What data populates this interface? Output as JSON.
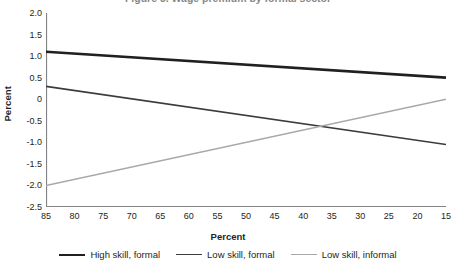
{
  "title": {
    "text": "Figure 3. Wage premium by formal sector",
    "clipped": true
  },
  "axis_titles": {
    "y": "Percent",
    "x": "Percent"
  },
  "colors": {
    "high_skill_formal": "#231f20",
    "low_skill_formal": "#3b3b3b",
    "low_skill_informal": "#a6a8ab",
    "axis": "#808285",
    "text": "#231f20"
  },
  "legend": {
    "position": "bottom",
    "items": [
      {
        "label": "High skill, formal",
        "color": "#231f20",
        "width": 2.6
      },
      {
        "label": "Low skill, formal",
        "color": "#3b3b3b",
        "width": 1.8
      },
      {
        "label": "Low skill, informal",
        "color": "#a6a8ab",
        "width": 1.4
      }
    ]
  },
  "chart_data": {
    "type": "line",
    "title": "Figure 3. Wage premium by formal sector",
    "xlabel": "Percent",
    "ylabel": "Percent",
    "xlim": [
      85,
      15
    ],
    "ylim": [
      -2.5,
      2.0
    ],
    "x_reversed": true,
    "grid": false,
    "xticks": [
      85,
      80,
      75,
      70,
      65,
      60,
      55,
      50,
      45,
      40,
      35,
      30,
      25,
      20,
      15
    ],
    "yticks": [
      2.0,
      1.5,
      1.0,
      0.5,
      0,
      -0.5,
      -1.0,
      -1.5,
      -2.0,
      -2.5
    ],
    "ytick_labels": [
      "2.0",
      "1.5",
      "1.0",
      "0.5",
      "0",
      "-0.5",
      "-1.0",
      "-1.5",
      "-2.0",
      "-2.5"
    ],
    "x": [
      85,
      15
    ],
    "series": [
      {
        "name": "High skill, formal",
        "color": "#231f20",
        "values": [
          1.1,
          0.5
        ]
      },
      {
        "name": "Low skill, formal",
        "color": "#3b3b3b",
        "values": [
          0.3,
          -1.05
        ]
      },
      {
        "name": "Low skill, informal",
        "color": "#a6a8ab",
        "values": [
          -2.0,
          0.0
        ]
      }
    ],
    "annotations": [
      {
        "text": "Low skill formal and informal lines cross near x = 37, y = -0.6"
      }
    ]
  }
}
